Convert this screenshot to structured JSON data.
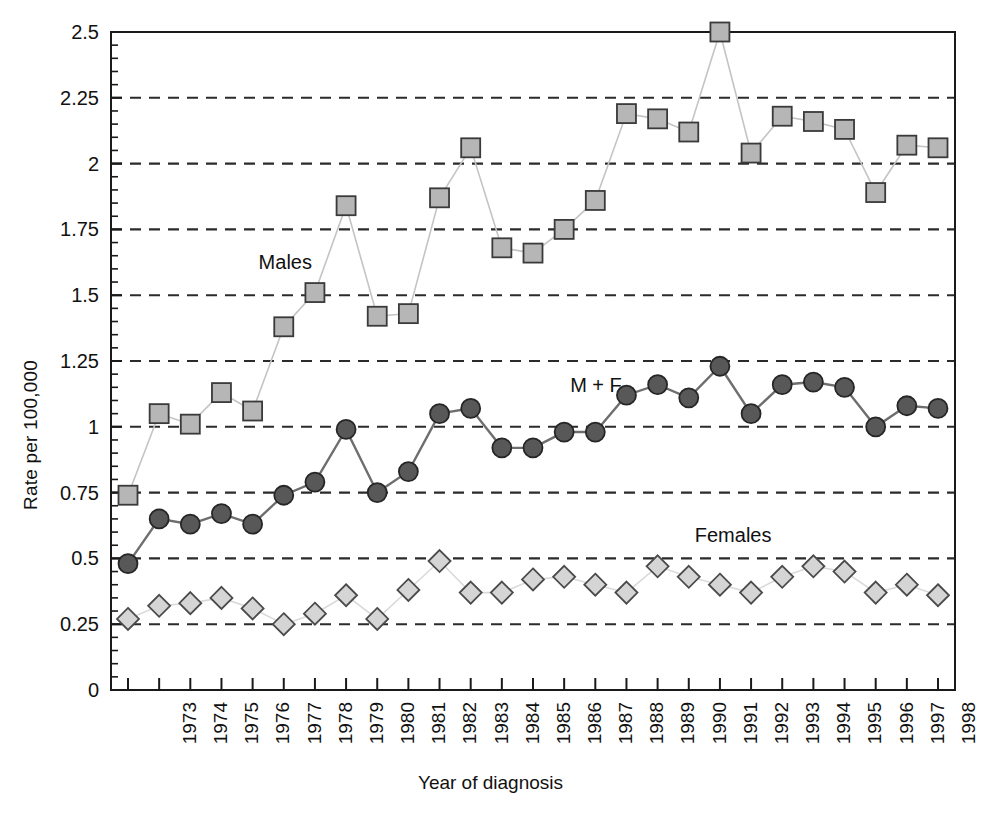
{
  "chart_data": {
    "type": "line",
    "title": "",
    "xlabel": "Year of diagnosis",
    "ylabel": "Rate per 100,000",
    "ylim": [
      0,
      2.5
    ],
    "ytick_labels": [
      "0",
      "0.25",
      "0.5",
      "0.75",
      "1",
      "1.25",
      "1.5",
      "1.75",
      "2",
      "2.25",
      "2.5"
    ],
    "ytick_values": [
      0,
      0.25,
      0.5,
      0.75,
      1,
      1.25,
      1.5,
      1.75,
      2,
      2.25,
      2.5
    ],
    "yminor_step": 0.05,
    "grid": "horizontal dashed at major ticks (0.25 interval), no gridline at 0 or 2.5",
    "legend_position": "inline annotations next to each series",
    "categories": [
      "1973",
      "1974",
      "1975",
      "1976",
      "1977",
      "1978",
      "1979",
      "1980",
      "1981",
      "1982",
      "1983",
      "1984",
      "1985",
      "1986",
      "1987",
      "1988",
      "1989",
      "1990",
      "1991",
      "1992",
      "1993",
      "1994",
      "1995",
      "1996",
      "1997",
      "1998",
      "1999"
    ],
    "x": [
      1973,
      1974,
      1975,
      1976,
      1977,
      1978,
      1979,
      1980,
      1981,
      1982,
      1983,
      1984,
      1985,
      1986,
      1987,
      1988,
      1989,
      1990,
      1991,
      1992,
      1993,
      1994,
      1995,
      1996,
      1997,
      1998,
      1999
    ],
    "series": [
      {
        "name": "Males",
        "marker": "square",
        "marker_fill": "#b6b6b6",
        "marker_stroke": "#3a3a3a",
        "line_color": "#c4c4c4",
        "values": [
          0.74,
          1.05,
          1.01,
          1.13,
          1.06,
          1.38,
          1.51,
          1.84,
          1.42,
          1.43,
          1.87,
          2.06,
          1.68,
          1.66,
          1.75,
          1.86,
          2.19,
          2.17,
          2.12,
          2.5,
          2.04,
          2.18,
          2.16,
          2.13,
          1.89,
          2.07,
          2.06
        ]
      },
      {
        "name": "M + F",
        "marker": "circle",
        "marker_fill": "#585858",
        "marker_stroke": "#262626",
        "line_color": "#6e6e6e",
        "values": [
          0.48,
          0.65,
          0.63,
          0.67,
          0.63,
          0.74,
          0.79,
          0.99,
          0.75,
          0.83,
          1.05,
          1.07,
          0.92,
          0.92,
          0.98,
          0.98,
          1.12,
          1.16,
          1.11,
          1.23,
          1.05,
          1.16,
          1.17,
          1.15,
          1.0,
          1.08,
          1.07
        ]
      },
      {
        "name": "Females",
        "marker": "diamond",
        "marker_fill": "#d5d5d5",
        "marker_stroke": "#4a4a4a",
        "line_color": "#dadada",
        "values": [
          0.27,
          0.32,
          0.33,
          0.35,
          0.31,
          0.25,
          0.29,
          0.36,
          0.27,
          0.38,
          0.49,
          0.37,
          0.37,
          0.42,
          0.43,
          0.4,
          0.37,
          0.47,
          0.43,
          0.4,
          0.37,
          0.43,
          0.47,
          0.45,
          0.37,
          0.4,
          0.36
        ]
      }
    ],
    "annotations": [
      {
        "text": "Males",
        "x_year": 1977,
        "y_value": 1.62
      },
      {
        "text": "M + F",
        "x_year": 1987,
        "y_value": 1.15
      },
      {
        "text": "Females",
        "x_year": 1991,
        "y_value": 0.58
      }
    ],
    "colors": {
      "axis": "#1a1a1a",
      "grid": "#2b2b2b",
      "background": "#ffffff",
      "males_marker": "#b6b6b6",
      "mf_marker": "#585858",
      "females_marker": "#d5d5d5"
    }
  }
}
